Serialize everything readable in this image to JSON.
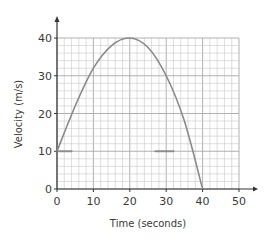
{
  "chart_data": {
    "type": "line",
    "title": "",
    "xlabel": "Time (seconds)",
    "ylabel": "Velocity (m/s)",
    "xlim": [
      0,
      50
    ],
    "ylim": [
      0,
      40
    ],
    "x_ticks": [
      "0",
      "10",
      "20",
      "30",
      "40",
      "50"
    ],
    "y_ticks": [
      "0",
      "10",
      "20",
      "30",
      "40"
    ],
    "grid": true,
    "grid_minor_step": 2,
    "legend": null,
    "series": [
      {
        "name": "velocity",
        "x": [
          0,
          5,
          10,
          15,
          20,
          25,
          30,
          35,
          40
        ],
        "y": [
          10,
          22,
          32,
          38,
          40,
          37.5,
          30,
          18,
          0
        ]
      }
    ],
    "annotations": [
      {
        "type": "short-horizontal-mark",
        "y": 10,
        "x_range": [
          0,
          4
        ]
      },
      {
        "type": "short-horizontal-mark",
        "y": 10,
        "x_range": [
          27,
          32
        ]
      }
    ],
    "colors": {
      "curve": "#8a8a8a",
      "grid": "#c8c8c8",
      "axis": "#333333"
    }
  }
}
